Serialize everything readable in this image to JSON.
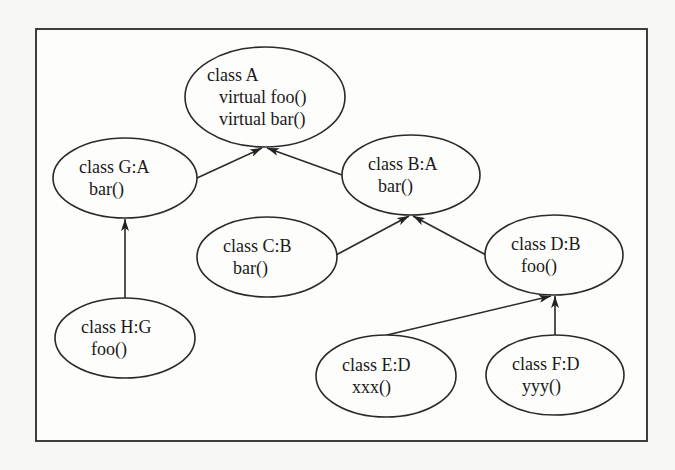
{
  "diagram": {
    "type": "class-inheritance-hierarchy",
    "frame": {
      "x": 36,
      "y": 29,
      "width": 611,
      "height": 412
    },
    "colors": {
      "stroke": "#2a2a2a",
      "text": "#1a1a1a",
      "background": "#f7f7f5",
      "fill": "#ffffff"
    },
    "nodes": [
      {
        "id": "A",
        "cx": 265,
        "cy": 97,
        "rx": 80,
        "ry": 50,
        "title": "class A",
        "members": [
          "virtual foo()",
          "virtual bar()"
        ]
      },
      {
        "id": "G",
        "cx": 125,
        "cy": 178,
        "rx": 72,
        "ry": 40,
        "title": "class G:A",
        "members": [
          "bar()"
        ]
      },
      {
        "id": "B",
        "cx": 411,
        "cy": 175,
        "rx": 69,
        "ry": 40,
        "title": "class B:A",
        "members": [
          "bar()"
        ]
      },
      {
        "id": "C",
        "cx": 267,
        "cy": 257,
        "rx": 70,
        "ry": 40,
        "title": "class C:B",
        "members": [
          "bar()"
        ]
      },
      {
        "id": "D",
        "cx": 554,
        "cy": 255,
        "rx": 69,
        "ry": 40,
        "title": "class D:B",
        "members": [
          "foo()"
        ]
      },
      {
        "id": "H",
        "cx": 125,
        "cy": 338,
        "rx": 70,
        "ry": 40,
        "title": "class H:G",
        "members": [
          "foo()"
        ]
      },
      {
        "id": "E",
        "cx": 386,
        "cy": 376,
        "rx": 70,
        "ry": 41,
        "title": "class E:D",
        "members": [
          "xxx()"
        ]
      },
      {
        "id": "F",
        "cx": 555,
        "cy": 375,
        "rx": 69,
        "ry": 40,
        "title": "class F:D",
        "members": [
          "yyy()"
        ]
      }
    ],
    "edges": [
      {
        "from": "G",
        "to": "A",
        "x1": 197,
        "y1": 178,
        "x2": 262,
        "y2": 148
      },
      {
        "from": "B",
        "to": "A",
        "x1": 342,
        "y1": 175,
        "x2": 267,
        "y2": 148
      },
      {
        "from": "H",
        "to": "G",
        "x1": 125,
        "y1": 298,
        "x2": 125,
        "y2": 219
      },
      {
        "from": "C",
        "to": "B",
        "x1": 336,
        "y1": 255,
        "x2": 409,
        "y2": 216
      },
      {
        "from": "D",
        "to": "B",
        "x1": 486,
        "y1": 255,
        "x2": 413,
        "y2": 216
      },
      {
        "from": "E",
        "to": "D",
        "x1": 387,
        "y1": 335,
        "x2": 551,
        "y2": 296
      },
      {
        "from": "F",
        "to": "D",
        "x1": 555,
        "y1": 335,
        "x2": 555,
        "y2": 296
      }
    ]
  }
}
